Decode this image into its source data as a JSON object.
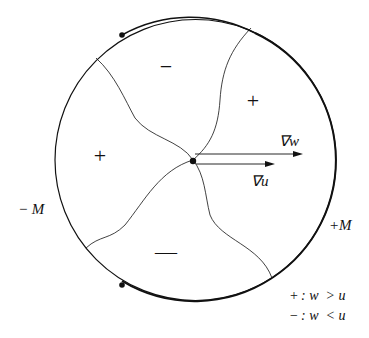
{
  "diagram": {
    "regions": [
      {
        "sign": "−",
        "label": "minus-top"
      },
      {
        "sign": "+",
        "label": "plus-right"
      },
      {
        "sign": "+",
        "label": "plus-left"
      },
      {
        "sign": "—",
        "label": "minus-bottom"
      }
    ],
    "vectors": {
      "grad_w": "∇w",
      "grad_u": "∇u"
    },
    "boundary_labels": {
      "left": "− M",
      "right": "+M"
    },
    "legend": [
      {
        "sign": "+",
        "text": ": w  > u"
      },
      {
        "sign": "−",
        "text": ": w  < u"
      }
    ]
  }
}
